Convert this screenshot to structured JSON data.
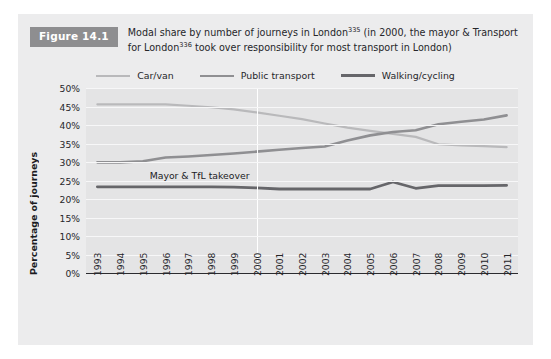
{
  "figure": {
    "badge": "Figure 14.1",
    "caption_line1_a": "Modal share by number of journeys in London",
    "caption_sup1": "335",
    "caption_line1_b": " (in 2000, the mayor &",
    "caption_line2_a": "Transport for London",
    "caption_sup2": "336",
    "caption_line2_b": " took over responsibility for most transport in London)"
  },
  "colors": {
    "panel_background": "#ececed",
    "plot_background": "#e4e4e5",
    "gridline": "#f7f7f8",
    "badge_background": "#8e8e90",
    "axis": "#2b2b2f",
    "car_van": "#b9b9bb",
    "public_transport": "#8f8f92",
    "walking_cycling": "#66666a",
    "takeover_line": "#ffffff"
  },
  "chart_data": {
    "type": "line",
    "title": "Modal share by number of journeys in London",
    "xlabel": "",
    "ylabel": "Percentage of journeys",
    "ylim": [
      0,
      50
    ],
    "ytick_labels": [
      "0%",
      "5%",
      "10%",
      "15%",
      "20%",
      "25%",
      "30%",
      "35%",
      "40%",
      "45%",
      "50%"
    ],
    "ytick_values": [
      0,
      5,
      10,
      15,
      20,
      25,
      30,
      35,
      40,
      45,
      50
    ],
    "grid": true,
    "legend_position": "top-center",
    "x": [
      1993,
      1994,
      1995,
      1996,
      1997,
      1998,
      1999,
      2000,
      2001,
      2002,
      2003,
      2004,
      2005,
      2006,
      2007,
      2008,
      2009,
      2010,
      2011
    ],
    "categories": [
      "1993",
      "1994",
      "1995",
      "1996",
      "1997",
      "1998",
      "1999",
      "2000",
      "2001",
      "2002",
      "2003",
      "2004",
      "2005",
      "2006",
      "2007",
      "2008",
      "2009",
      "2010",
      "2011"
    ],
    "series": [
      {
        "name": "Car/van",
        "color": "#b9b9bb",
        "values": [
          45.6,
          45.6,
          45.6,
          45.6,
          45.2,
          44.8,
          44.2,
          43.4,
          42.5,
          41.6,
          40.4,
          39.3,
          38.4,
          37.6,
          36.8,
          34.8,
          34.5,
          34.3,
          34.0
        ]
      },
      {
        "name": "Public transport",
        "color": "#8f8f92",
        "values": [
          29.9,
          29.9,
          30.2,
          31.2,
          31.5,
          31.9,
          32.3,
          32.8,
          33.3,
          33.8,
          34.2,
          35.8,
          37.2,
          38.1,
          38.6,
          40.2,
          40.9,
          41.5,
          42.6
        ]
      },
      {
        "name": "Walking/cycling",
        "color": "#66666a",
        "values": [
          23.3,
          23.3,
          23.3,
          23.3,
          23.3,
          23.3,
          23.2,
          23.0,
          22.7,
          22.7,
          22.7,
          22.7,
          22.7,
          24.6,
          22.9,
          23.6,
          23.6,
          23.6,
          23.7
        ]
      }
    ],
    "annotations": [
      {
        "text": "Mayor & TfL takeover",
        "x": 2000,
        "y": 26.5,
        "marker": "vertical-line"
      }
    ]
  }
}
